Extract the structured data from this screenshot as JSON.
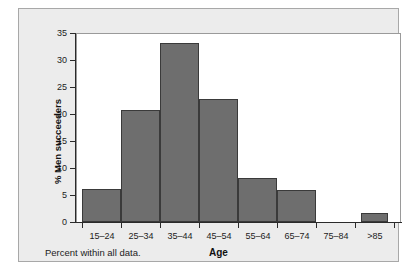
{
  "chart_data": {
    "type": "bar",
    "title": "",
    "subtitle": "",
    "xlabel": "Age",
    "ylabel": "% Men succeeders",
    "caption": "Percent within all data.",
    "categories": [
      "15–24",
      "25–34",
      "35–44",
      "45–54",
      "55–64",
      "65–74",
      "75–84",
      ">85"
    ],
    "values": [
      6.2,
      20.7,
      33.1,
      22.7,
      8.1,
      6.0,
      0.0,
      1.6
    ],
    "ylim": [
      0,
      35
    ],
    "yticks": [
      0,
      5,
      10,
      15,
      20,
      25,
      30,
      35
    ],
    "ytick_labels": [
      "0",
      "5",
      "10",
      "15",
      "20",
      "25",
      "30",
      "35"
    ],
    "grid": false,
    "legend": "none",
    "bar_color": "#6e6e6e",
    "bar_edge_color": "#3a3a3a",
    "panel_color": "#ececec",
    "plot_background": "#ffffff"
  }
}
